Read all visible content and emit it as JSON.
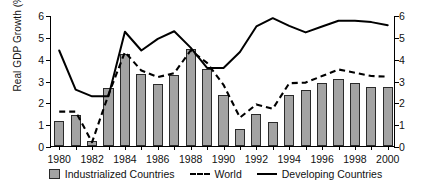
{
  "chart_data": {
    "type": "bar",
    "title": "",
    "xlabel": "",
    "ylabel": "Real GDP Growth (%)",
    "ylim": [
      0,
      6
    ],
    "yticks": [
      0,
      1,
      2,
      3,
      4,
      5,
      6
    ],
    "right_axis": {
      "ylim": [
        0,
        6
      ],
      "yticks": [
        0,
        1,
        2,
        3,
        4,
        5,
        6
      ]
    },
    "grid": false,
    "legend_position": "bottom",
    "x": [
      1980,
      1981,
      1982,
      1983,
      1984,
      1985,
      1986,
      1987,
      1988,
      1989,
      1990,
      1991,
      1992,
      1993,
      1994,
      1995,
      1996,
      1997,
      1998,
      1999,
      2000
    ],
    "xtick_labels": [
      "1980",
      "1982",
      "1984",
      "1986",
      "1988",
      "1990",
      "1992",
      "1994",
      "1996",
      "1998",
      "2000"
    ],
    "xticks": [
      1980,
      1982,
      1984,
      1986,
      1988,
      1990,
      1992,
      1994,
      1996,
      1998,
      2000
    ],
    "series": [
      {
        "name": "Industrialized Countries",
        "kind": "bar",
        "color": "#a3a3a3",
        "values": [
          1.15,
          1.4,
          0.25,
          2.65,
          4.2,
          3.32,
          2.85,
          3.25,
          4.45,
          3.52,
          2.33,
          0.78,
          1.47,
          1.1,
          2.35,
          2.55,
          2.88,
          3.08,
          2.88,
          2.7,
          2.7
        ]
      },
      {
        "name": "World",
        "kind": "dashed-line",
        "color": "#000000",
        "values": [
          1.62,
          1.62,
          0.22,
          2.4,
          4.35,
          3.5,
          3.2,
          3.38,
          4.42,
          3.85,
          2.85,
          1.35,
          1.95,
          1.75,
          2.92,
          2.95,
          3.25,
          3.55,
          3.4,
          3.25,
          3.22
        ]
      },
      {
        "name": "Developing Countries",
        "kind": "solid-line",
        "color": "#000000",
        "values": [
          4.42,
          2.63,
          2.32,
          2.32,
          5.28,
          4.42,
          4.95,
          5.3,
          4.55,
          3.62,
          3.62,
          4.35,
          5.52,
          5.9,
          5.55,
          5.25,
          5.52,
          5.78,
          5.78,
          5.72,
          5.58
        ]
      }
    ]
  },
  "legend": {
    "items": [
      {
        "label": "Industrialized Countries",
        "marker": "bar-swatch"
      },
      {
        "label": "World",
        "marker": "dashed-line-swatch"
      },
      {
        "label": "Developing Countries",
        "marker": "solid-line-swatch"
      }
    ]
  }
}
